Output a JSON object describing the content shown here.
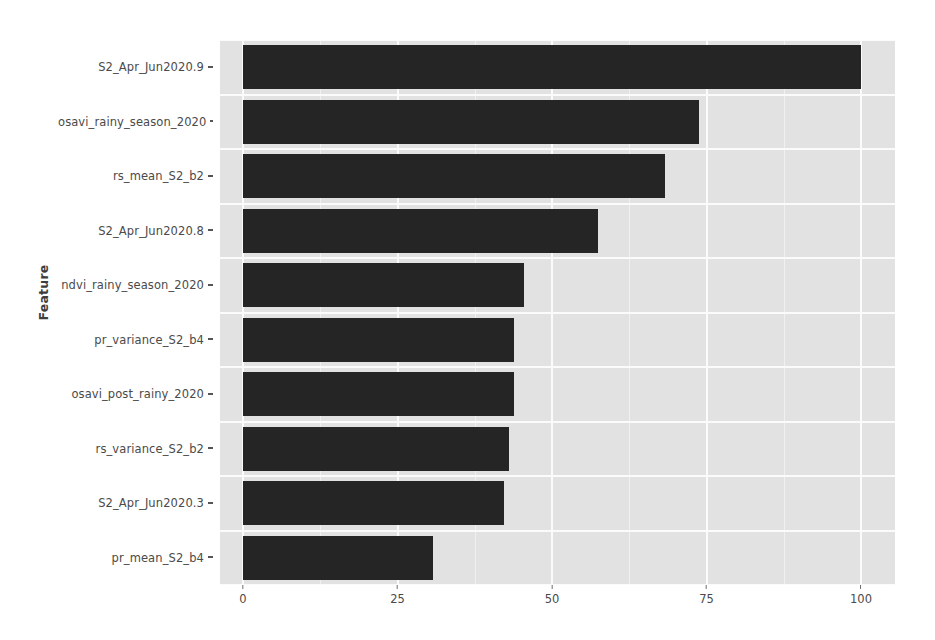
{
  "chart_data": {
    "type": "bar",
    "orientation": "horizontal",
    "title": "",
    "xlabel": "",
    "ylabel": "Feature",
    "xlim": [
      0,
      105
    ],
    "xticks": [
      0,
      25,
      50,
      75,
      100
    ],
    "xtick_labels": [
      "0",
      "25",
      "50",
      "75",
      "100"
    ],
    "grid": true,
    "legend": "none",
    "bar_color": "#252525",
    "panel_background": "#e2e2e2",
    "gridline_color": "#fbfbfb",
    "categories": [
      "S2_Apr_Jun2020.9",
      "osavi_rainy_season_2020",
      "rs_mean_S2_b2",
      "S2_Apr_Jun2020.8",
      "ndvi_rainy_season_2020",
      "pr_variance_S2_b4",
      "osavi_post_rainy_2020",
      "rs_variance_S2_b2",
      "S2_Apr_Jun2020.3",
      "pr_mean_S2_b4"
    ],
    "values": [
      100,
      73.8,
      68.3,
      57.4,
      45.5,
      43.8,
      43.8,
      43.0,
      42.2,
      30.7
    ]
  },
  "axis": {
    "y_title": "Feature"
  }
}
